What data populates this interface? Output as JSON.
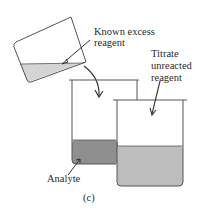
{
  "diagram": {
    "panel_label": "(c)",
    "labels": {
      "known_excess_line1": "Known excess",
      "known_excess_line2": "reagent",
      "titrate_line1": "Titrate",
      "titrate_line2": "unreacted",
      "titrate_line3": "reagent",
      "analyte": "Analyte"
    },
    "colors": {
      "outline": "#555555",
      "reagent_fill": "#d4d4d4",
      "analyte_fill": "#8f8f8f",
      "unreacted_fill": "#bdbdbd",
      "background": "#ffffff"
    }
  }
}
